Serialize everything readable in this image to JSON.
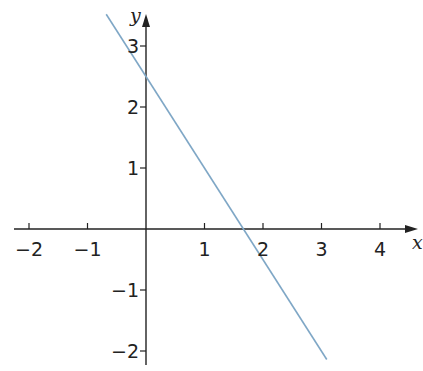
{
  "chart_data": {
    "type": "line",
    "title": "",
    "xlabel": "x",
    "ylabel": "y",
    "xlim": [
      -2.25,
      4.65
    ],
    "ylim": [
      -2.25,
      3.55
    ],
    "grid": false,
    "x_ticks": [
      -2,
      -1,
      1,
      2,
      3,
      4
    ],
    "x_tick_labels": [
      "−2",
      "−1",
      "1",
      "2",
      "3",
      "4"
    ],
    "y_ticks": [
      -2,
      -1,
      1,
      2,
      3
    ],
    "y_tick_labels": [
      "−2",
      "−1",
      "1",
      "2",
      "3"
    ],
    "series": [
      {
        "name": "y = 2.5 − 1.5x",
        "color": "#7fa7c6",
        "x": [
          -0.68,
          3.09
        ],
        "y": [
          3.52,
          -2.14
        ]
      }
    ],
    "annotations": {
      "y_intercept": 2.5,
      "x_intercept": 1.67
    }
  },
  "colors": {
    "axis": "#222222",
    "line": "#7fa7c6",
    "background": "#ffffff"
  }
}
